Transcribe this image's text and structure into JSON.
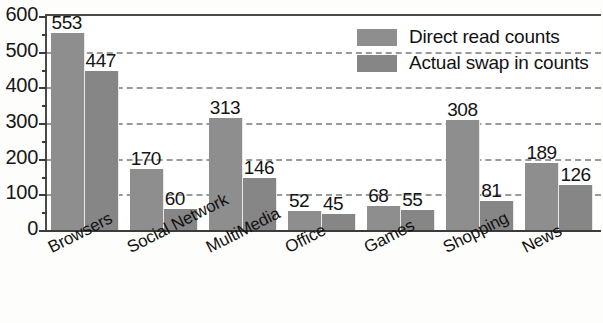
{
  "chart_data": {
    "type": "bar",
    "title": "",
    "xlabel": "",
    "ylabel": "",
    "ylim": [
      0,
      600
    ],
    "y_ticks": [
      0,
      100,
      200,
      300,
      400,
      500,
      600
    ],
    "y_minor_tick_step": 50,
    "grid": true,
    "grid_style": "dashed",
    "legend_position": "top-right",
    "categories": [
      "Browsers",
      "Social Network",
      "MultiMedia",
      "Office",
      "Games",
      "Shopping",
      "News"
    ],
    "series": [
      {
        "name": "Direct read counts",
        "color": "#8e8e8e",
        "values": [
          553,
          170,
          313,
          52,
          68,
          308,
          189
        ]
      },
      {
        "name": "Actual swap in counts",
        "color": "#868686",
        "values": [
          447,
          60,
          146,
          45,
          55,
          81,
          126
        ]
      }
    ]
  },
  "axis": {
    "y_tick_labels": [
      "600",
      "500",
      "400",
      "300",
      "200",
      "100",
      "0"
    ]
  },
  "legend": {
    "items": [
      {
        "label": "Direct read counts",
        "swatch": "legend-swatch-direct-read"
      },
      {
        "label": "Actual swap in counts",
        "swatch": "legend-swatch-actual-swap"
      }
    ]
  }
}
